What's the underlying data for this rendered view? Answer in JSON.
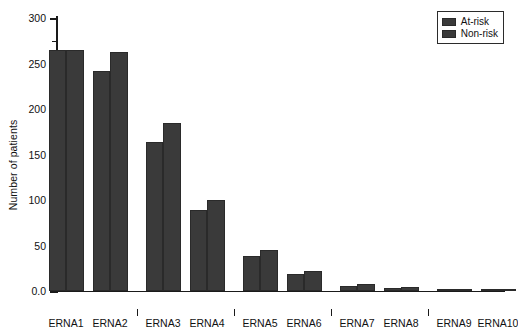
{
  "chart_data": {
    "type": "bar",
    "title": "",
    "xlabel": "",
    "ylabel": "Number of patients",
    "ylim": [
      0,
      300
    ],
    "yticks": [
      "0.0",
      "50",
      "100",
      "150",
      "200",
      "250",
      "300"
    ],
    "ytick_values": [
      0,
      50,
      100,
      150,
      200,
      250,
      300
    ],
    "minor_ticks": [
      25,
      75,
      125,
      175,
      225,
      275
    ],
    "grid": false,
    "legend_position": "top-right",
    "categories": [
      "ERNA1",
      "ERNA2",
      "ERNA3",
      "ERNA4",
      "ERNA5",
      "ERNA6",
      "ERNA7",
      "ERNA8",
      "ERNA9",
      "ERNA10"
    ],
    "series": [
      {
        "name": "At-risk",
        "color": "#3a3a3a",
        "values": [
          265,
          242,
          164,
          89,
          38,
          19,
          6,
          3,
          1,
          1
        ]
      },
      {
        "name": "Non-risk",
        "color": "#3a3a3a",
        "values": [
          265,
          263,
          185,
          100,
          45,
          22,
          8,
          4,
          2,
          2
        ]
      }
    ]
  },
  "legend": {
    "entries": [
      {
        "label": "At-risk"
      },
      {
        "label": "Non-risk"
      }
    ]
  },
  "axis": {
    "y_title": "Number of patients"
  },
  "colors": {
    "bar": "#3a3a3a",
    "axis": "#1a1a1a",
    "background": "#ffffff"
  }
}
